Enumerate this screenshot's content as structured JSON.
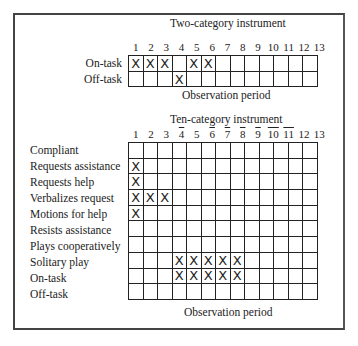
{
  "two_category": {
    "title": "Two-category instrument",
    "periods": [
      "1",
      "2",
      "3",
      "4",
      "5",
      "6",
      "7",
      "8",
      "9",
      "10",
      "11",
      "12",
      "13"
    ],
    "rows": [
      {
        "label": "On-task",
        "marks": [
          "X",
          "X",
          "X",
          "",
          "X",
          "X",
          "",
          "",
          "",
          "",
          "",
          "",
          ""
        ]
      },
      {
        "label": "Off-task",
        "marks": [
          "",
          "",
          "",
          "X",
          "",
          "",
          "",
          "",
          "",
          "",
          "",
          "",
          ""
        ]
      }
    ],
    "xlabel": "Observation period"
  },
  "ten_category": {
    "title": "Ten-category instrument",
    "periods": [
      "1",
      "2",
      "3",
      "4",
      "5",
      "6",
      "7",
      "8",
      "9",
      "10",
      "11",
      "12",
      "13"
    ],
    "overlined_periods": [
      4,
      6,
      7,
      8,
      9,
      10,
      11
    ],
    "rows": [
      {
        "label": "Compliant",
        "marks": [
          "",
          "",
          "",
          "",
          "",
          "",
          "",
          "",
          "",
          "",
          "",
          "",
          ""
        ]
      },
      {
        "label": "Requests assistance",
        "marks": [
          "X",
          "",
          "",
          "",
          "",
          "",
          "",
          "",
          "",
          "",
          "",
          "",
          ""
        ]
      },
      {
        "label": "Requests help",
        "marks": [
          "X",
          "",
          "",
          "",
          "",
          "",
          "",
          "",
          "",
          "",
          "",
          "",
          ""
        ]
      },
      {
        "label": "Verbalizes request",
        "marks": [
          "X",
          "X",
          "X",
          "",
          "",
          "",
          "",
          "",
          "",
          "",
          "",
          "",
          ""
        ]
      },
      {
        "label": "Motions for help",
        "marks": [
          "X",
          "",
          "",
          "",
          "",
          "",
          "",
          "",
          "",
          "",
          "",
          "",
          ""
        ]
      },
      {
        "label": "Resists assistance",
        "marks": [
          "",
          "",
          "",
          "",
          "",
          "",
          "",
          "",
          "",
          "",
          "",
          "",
          ""
        ]
      },
      {
        "label": "Plays cooperatively",
        "marks": [
          "",
          "",
          "",
          "",
          "",
          "",
          "",
          "",
          "",
          "",
          "",
          "",
          ""
        ]
      },
      {
        "label": "Solitary play",
        "marks": [
          "",
          "",
          "",
          "X",
          "X",
          "X",
          "X",
          "X",
          "",
          "",
          "",
          "",
          ""
        ]
      },
      {
        "label": "On-task",
        "marks": [
          "",
          "",
          "",
          "X",
          "X",
          "X",
          "X",
          "X",
          "",
          "",
          "",
          "",
          ""
        ]
      },
      {
        "label": "Off-task",
        "marks": [
          "",
          "",
          "",
          "",
          "",
          "",
          "",
          "",
          "",
          "",
          "",
          "",
          ""
        ]
      }
    ],
    "xlabel": "Observation period"
  }
}
